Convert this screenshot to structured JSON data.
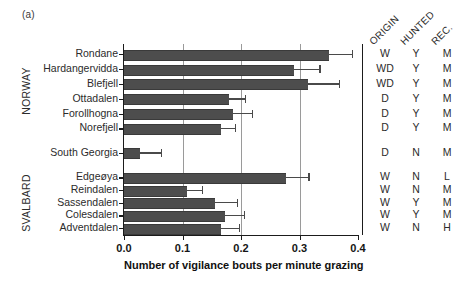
{
  "panel": {
    "letter": "(a)"
  },
  "chart_data": {
    "type": "bar",
    "orientation": "horizontal",
    "title": "",
    "xlabel": "Number of vigilance bouts per minute grazing",
    "ylabel": "",
    "xlim": [
      0.0,
      0.4
    ],
    "xticks": [
      "0.0",
      "0.1",
      "0.2",
      "0.3",
      "0.4"
    ],
    "xtick_values": [
      0.0,
      0.1,
      0.2,
      0.3,
      0.4
    ],
    "grid": "vertical gridlines at 0.1, 0.2, 0.3",
    "legend": "none",
    "categories": [
      "Rondane",
      "Hardangervidda",
      "Blefjell",
      "Ottadalen",
      "Forollhogna",
      "Norefjell",
      "South Georgia",
      "Edgeøya",
      "Reindalen",
      "Sassendalen",
      "Colesdalen",
      "Adventdalen"
    ],
    "values": [
      0.35,
      0.291,
      0.315,
      0.18,
      0.187,
      0.165,
      0.028,
      0.277,
      0.108,
      0.155,
      0.172,
      0.165
    ],
    "error_upper": [
      0.39,
      0.334,
      0.367,
      0.207,
      0.218,
      0.19,
      0.063,
      0.315,
      0.133,
      0.193,
      0.205,
      0.196
    ],
    "groups": [
      {
        "label": "NORWAY",
        "rows": [
          0,
          1,
          2,
          3,
          4,
          5
        ]
      },
      {
        "label": "SVALBARD",
        "rows": [
          7,
          8,
          9,
          10,
          11
        ]
      }
    ],
    "bar_color": "#4d4d4d",
    "error_color": "#4a4a4a",
    "axis_color": "#1b1b1b",
    "grid_color": "#9a9a9a"
  },
  "attribute_table": {
    "headers": [
      "ORIGIN",
      "HUNTED",
      "REC."
    ],
    "rows": [
      {
        "origin": "W",
        "hunted": "Y",
        "rec": "M"
      },
      {
        "origin": "WD",
        "hunted": "Y",
        "rec": "M"
      },
      {
        "origin": "WD",
        "hunted": "Y",
        "rec": "M"
      },
      {
        "origin": "D",
        "hunted": "Y",
        "rec": "M"
      },
      {
        "origin": "D",
        "hunted": "Y",
        "rec": "M"
      },
      {
        "origin": "D",
        "hunted": "Y",
        "rec": "M"
      },
      {
        "origin": "D",
        "hunted": "N",
        "rec": "M"
      },
      {
        "origin": "W",
        "hunted": "N",
        "rec": "L"
      },
      {
        "origin": "W",
        "hunted": "N",
        "rec": "M"
      },
      {
        "origin": "W",
        "hunted": "Y",
        "rec": "M"
      },
      {
        "origin": "W",
        "hunted": "Y",
        "rec": "M"
      },
      {
        "origin": "W",
        "hunted": "N",
        "rec": "H"
      }
    ]
  }
}
